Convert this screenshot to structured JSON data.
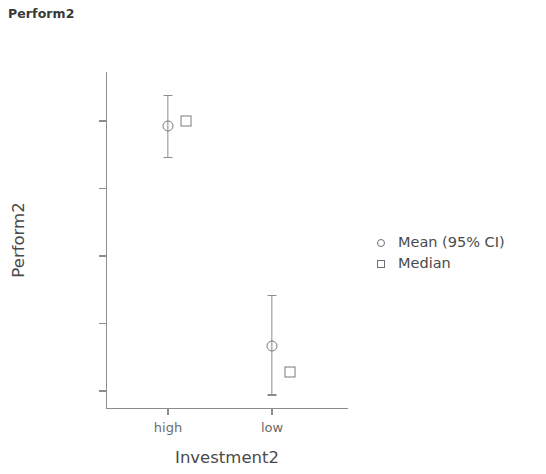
{
  "chart_data": {
    "type": "scatter",
    "title": "Perform2",
    "xlabel": "Investment2",
    "ylabel": "Perform2",
    "categories": [
      "high",
      "low"
    ],
    "yticks": [
      60,
      65,
      70,
      75,
      80
    ],
    "ylim": [
      59.0,
      83.0
    ],
    "grid": false,
    "legend_position": "right",
    "legend": [
      {
        "label": "Mean (95% CI)",
        "marker": "circle-open-icon"
      },
      {
        "label": "Median",
        "marker": "square-open-icon"
      }
    ],
    "series": [
      {
        "name": "Mean (95% CI)",
        "marker": "circle-open-icon",
        "values": [
          79.6,
          63.3
        ],
        "ci_lower": [
          77.3,
          59.7
        ],
        "ci_upper": [
          81.9,
          67.1
        ]
      },
      {
        "name": "Median",
        "marker": "square-open-icon",
        "values": [
          80.0,
          61.4
        ]
      }
    ],
    "points": [
      {
        "category": "high",
        "mean": 79.6,
        "ci_low": 77.3,
        "ci_high": 81.9,
        "median": 80.0
      },
      {
        "category": "low",
        "mean": 63.3,
        "ci_low": 59.7,
        "ci_high": 67.1,
        "median": 61.4
      }
    ],
    "colors": {
      "marker": "#7a7a7a",
      "axis": "#8c8c8c",
      "text": "#4a4a4a",
      "background": "#ffffff"
    }
  }
}
